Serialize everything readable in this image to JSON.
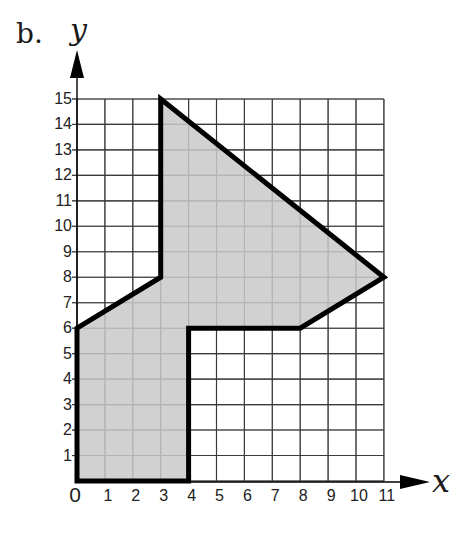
{
  "figure": {
    "part_label": "b.",
    "x_axis_name": "x",
    "y_axis_name": "y",
    "colors": {
      "fill": "#c9c9c9",
      "outline": "#000000",
      "grid": "#3a3a3a",
      "text": "#1a1a1a"
    }
  },
  "chart_data": {
    "type": "diagram",
    "title": "b.",
    "xlabel": "x",
    "ylabel": "y",
    "xlim": [
      0,
      11
    ],
    "ylim": [
      0,
      15
    ],
    "grid": true,
    "x_ticks": [
      "0",
      "1",
      "2",
      "3",
      "4",
      "5",
      "6",
      "7",
      "8",
      "9",
      "10",
      "11"
    ],
    "y_ticks": [
      "1",
      "2",
      "3",
      "4",
      "5",
      "6",
      "7",
      "8",
      "9",
      "10",
      "11",
      "12",
      "13",
      "14",
      "15"
    ],
    "shape": {
      "kind": "polygon",
      "fill": "gray",
      "vertices": [
        [
          0,
          0
        ],
        [
          4,
          0
        ],
        [
          4,
          6
        ],
        [
          8,
          6
        ],
        [
          11,
          8
        ],
        [
          3,
          15
        ],
        [
          3,
          8
        ],
        [
          0,
          6
        ]
      ]
    }
  }
}
